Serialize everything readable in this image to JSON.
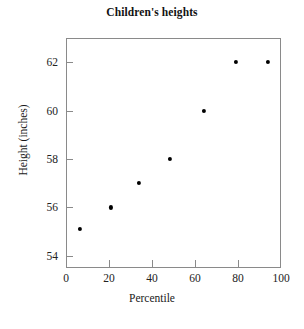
{
  "chart_data": {
    "type": "scatter",
    "title": "Children's heights",
    "xlabel": "Percentile",
    "ylabel": "Height (inches)",
    "xlim": [
      0,
      100
    ],
    "ylim": [
      53.5,
      63.0
    ],
    "grid": false,
    "legend": null,
    "xticks": [
      0,
      20,
      40,
      60,
      80,
      100
    ],
    "xtick_labels": [
      "0",
      "20",
      "40",
      "60",
      "80",
      "100"
    ],
    "yticks": [
      54,
      56,
      58,
      60,
      62
    ],
    "ytick_labels": [
      "54",
      "56",
      "58",
      "60",
      "62"
    ],
    "marker": "filled-circle",
    "marker_color": "#000000",
    "axis_color": "#8a8a8a",
    "points": [
      {
        "x": 6.5,
        "y": 55.1
      },
      {
        "x": 21.0,
        "y": 56.0
      },
      {
        "x": 34.0,
        "y": 57.0
      },
      {
        "x": 48.5,
        "y": 58.0
      },
      {
        "x": 64.0,
        "y": 60.0
      },
      {
        "x": 79.0,
        "y": 62.0
      },
      {
        "x": 94.0,
        "y": 62.0
      }
    ]
  }
}
